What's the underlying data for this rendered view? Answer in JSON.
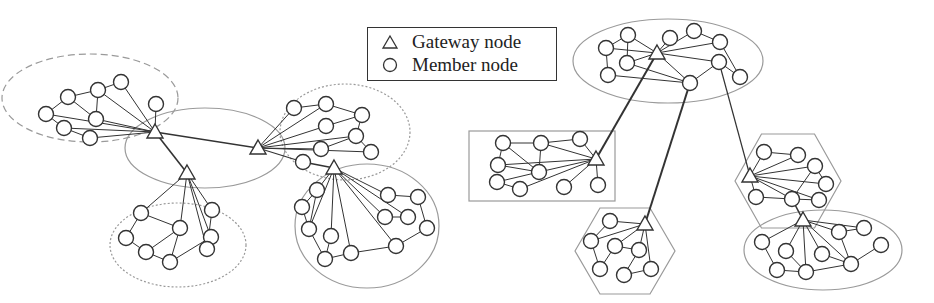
{
  "legend": {
    "items": [
      {
        "symbol": "triangle",
        "label": "Gateway node"
      },
      {
        "symbol": "circle",
        "label": "Member node"
      }
    ]
  },
  "colors": {
    "node_stroke": "#333333",
    "edge": "#333333",
    "cluster_stroke": "#9a9a9a",
    "node_fill": "#ffffff"
  },
  "diagrams": [
    {
      "name": "left-network",
      "clusters": [
        {
          "shape": "ellipse",
          "style": "dashed",
          "cx": 90,
          "cy": 98,
          "rx": 88,
          "ry": 44
        },
        {
          "shape": "ellipse",
          "style": "solid",
          "cx": 205,
          "cy": 148,
          "rx": 80,
          "ry": 40
        },
        {
          "shape": "ellipse",
          "style": "dotted",
          "cx": 345,
          "cy": 132,
          "rx": 65,
          "ry": 48
        },
        {
          "shape": "ellipse",
          "style": "dotted",
          "cx": 178,
          "cy": 245,
          "rx": 68,
          "ry": 42
        },
        {
          "shape": "ellipse",
          "style": "solid",
          "cx": 367,
          "cy": 226,
          "rx": 72,
          "ry": 62
        }
      ],
      "gateways": [
        {
          "id": "G1",
          "x": 155,
          "y": 132
        },
        {
          "id": "G2",
          "x": 258,
          "y": 148
        },
        {
          "id": "G3",
          "x": 187,
          "y": 173
        },
        {
          "id": "G4",
          "x": 334,
          "y": 168
        }
      ],
      "members": [
        {
          "id": "a1",
          "x": 46,
          "y": 114
        },
        {
          "id": "a2",
          "x": 68,
          "y": 97
        },
        {
          "id": "a3",
          "x": 98,
          "y": 90
        },
        {
          "id": "a4",
          "x": 121,
          "y": 82
        },
        {
          "id": "a5",
          "x": 96,
          "y": 119
        },
        {
          "id": "a6",
          "x": 64,
          "y": 128
        },
        {
          "id": "a7",
          "x": 90,
          "y": 138
        },
        {
          "id": "a8",
          "x": 156,
          "y": 104
        },
        {
          "id": "b1",
          "x": 294,
          "y": 108
        },
        {
          "id": "b2",
          "x": 326,
          "y": 104
        },
        {
          "id": "b3",
          "x": 362,
          "y": 115
        },
        {
          "id": "b4",
          "x": 326,
          "y": 126
        },
        {
          "id": "b5",
          "x": 356,
          "y": 136
        },
        {
          "id": "b6",
          "x": 321,
          "y": 149
        },
        {
          "id": "b7",
          "x": 371,
          "y": 152
        },
        {
          "id": "b8",
          "x": 303,
          "y": 162
        },
        {
          "id": "c1",
          "x": 141,
          "y": 213
        },
        {
          "id": "c2",
          "x": 180,
          "y": 228
        },
        {
          "id": "c3",
          "x": 211,
          "y": 237
        },
        {
          "id": "c4",
          "x": 212,
          "y": 210
        },
        {
          "id": "c5",
          "x": 126,
          "y": 238
        },
        {
          "id": "c6",
          "x": 146,
          "y": 252
        },
        {
          "id": "c7",
          "x": 170,
          "y": 262
        },
        {
          "id": "c8",
          "x": 207,
          "y": 249
        },
        {
          "id": "d1",
          "x": 317,
          "y": 190
        },
        {
          "id": "d2",
          "x": 302,
          "y": 207
        },
        {
          "id": "d3",
          "x": 309,
          "y": 229
        },
        {
          "id": "d4",
          "x": 331,
          "y": 236
        },
        {
          "id": "d5",
          "x": 325,
          "y": 259
        },
        {
          "id": "d6",
          "x": 351,
          "y": 253
        },
        {
          "id": "d7",
          "x": 388,
          "y": 195
        },
        {
          "id": "d8",
          "x": 418,
          "y": 197
        },
        {
          "id": "d9",
          "x": 385,
          "y": 217
        },
        {
          "id": "d10",
          "x": 408,
          "y": 217
        },
        {
          "id": "d11",
          "x": 427,
          "y": 228
        },
        {
          "id": "d12",
          "x": 396,
          "y": 246
        }
      ],
      "edges": [
        [
          "G1",
          "G2",
          1.6
        ],
        [
          "G1",
          "G3",
          1.6
        ],
        [
          "G2",
          "b8",
          1.2
        ],
        [
          "b8",
          "G4",
          1.6
        ],
        [
          "a1",
          "a2",
          1
        ],
        [
          "a2",
          "a3",
          1
        ],
        [
          "a3",
          "a4",
          1
        ],
        [
          "a3",
          "a5",
          1
        ],
        [
          "a2",
          "a5",
          1
        ],
        [
          "a1",
          "a6",
          1
        ],
        [
          "a6",
          "a7",
          1
        ],
        [
          "a1",
          "G1",
          1
        ],
        [
          "a3",
          "G1",
          1
        ],
        [
          "a4",
          "G1",
          1
        ],
        [
          "a5",
          "G1",
          1
        ],
        [
          "a6",
          "G1",
          1
        ],
        [
          "a7",
          "G1",
          1
        ],
        [
          "a8",
          "G1",
          1
        ],
        [
          "b1",
          "b2",
          1
        ],
        [
          "b2",
          "b3",
          1
        ],
        [
          "b3",
          "b5",
          1
        ],
        [
          "b4",
          "b3",
          1
        ],
        [
          "b5",
          "b7",
          1
        ],
        [
          "b6",
          "b5",
          1
        ],
        [
          "G2",
          "b1",
          1
        ],
        [
          "G2",
          "b2",
          1
        ],
        [
          "G2",
          "b4",
          1
        ],
        [
          "G2",
          "b5",
          1
        ],
        [
          "G2",
          "b6",
          1
        ],
        [
          "G2",
          "b7",
          1
        ],
        [
          "c1",
          "c5",
          1
        ],
        [
          "c5",
          "c6",
          1
        ],
        [
          "c6",
          "c7",
          1
        ],
        [
          "c7",
          "c3",
          1
        ],
        [
          "c3",
          "c8",
          1
        ],
        [
          "c1",
          "c2",
          1
        ],
        [
          "c2",
          "c6",
          1
        ],
        [
          "c2",
          "c7",
          1
        ],
        [
          "c3",
          "c8",
          1
        ],
        [
          "c4",
          "c8",
          1
        ],
        [
          "G3",
          "c1",
          1
        ],
        [
          "G3",
          "c2",
          1
        ],
        [
          "G3",
          "c3",
          1
        ],
        [
          "G3",
          "c4",
          1
        ],
        [
          "G3",
          "c8",
          1
        ],
        [
          "d1",
          "d2",
          1
        ],
        [
          "d2",
          "d3",
          1
        ],
        [
          "d1",
          "d3",
          1
        ],
        [
          "d3",
          "d5",
          1
        ],
        [
          "d4",
          "d5",
          1
        ],
        [
          "d5",
          "d6",
          1
        ],
        [
          "d6",
          "d12",
          1
        ],
        [
          "d12",
          "d11",
          1
        ],
        [
          "d11",
          "d8",
          1
        ],
        [
          "d8",
          "d7",
          1
        ],
        [
          "d9",
          "d10",
          1
        ],
        [
          "G4",
          "d1",
          1
        ],
        [
          "G4",
          "d3",
          1
        ],
        [
          "G4",
          "d4",
          1
        ],
        [
          "G4",
          "d6",
          1
        ],
        [
          "G4",
          "d7",
          1
        ],
        [
          "G4",
          "d9",
          1
        ],
        [
          "G4",
          "d10",
          1
        ],
        [
          "G4",
          "d12",
          1
        ]
      ]
    },
    {
      "name": "right-network",
      "clusters": [
        {
          "shape": "ellipse",
          "style": "solid",
          "cx": 668,
          "cy": 61,
          "rx": 95,
          "ry": 42
        },
        {
          "shape": "rect",
          "style": "solid",
          "x": 469,
          "y": 131,
          "w": 146,
          "h": 70
        },
        {
          "shape": "hexagon",
          "style": "solid",
          "cx": 625,
          "cy": 251,
          "rx": 50,
          "ry": 43
        },
        {
          "shape": "hexagon",
          "style": "solid",
          "cx": 788,
          "cy": 181,
          "rx": 53,
          "ry": 47
        },
        {
          "shape": "ellipse",
          "style": "solid",
          "cx": 823,
          "cy": 250,
          "rx": 79,
          "ry": 40
        }
      ],
      "gateways": [
        {
          "id": "H1",
          "x": 657,
          "y": 53
        },
        {
          "id": "H2",
          "x": 596,
          "y": 159
        },
        {
          "id": "H3",
          "x": 645,
          "y": 224
        },
        {
          "id": "H4",
          "x": 750,
          "y": 176
        },
        {
          "id": "H5",
          "x": 803,
          "y": 220
        }
      ],
      "members": [
        {
          "id": "e1",
          "x": 628,
          "y": 35
        },
        {
          "id": "e2",
          "x": 670,
          "y": 38
        },
        {
          "id": "e3",
          "x": 694,
          "y": 31
        },
        {
          "id": "e4",
          "x": 720,
          "y": 42
        },
        {
          "id": "e5",
          "x": 606,
          "y": 48
        },
        {
          "id": "e6",
          "x": 627,
          "y": 63
        },
        {
          "id": "e7",
          "x": 608,
          "y": 75
        },
        {
          "id": "e8",
          "x": 719,
          "y": 62
        },
        {
          "id": "e9",
          "x": 740,
          "y": 77
        },
        {
          "id": "e10",
          "x": 690,
          "y": 83
        },
        {
          "id": "f1",
          "x": 503,
          "y": 143
        },
        {
          "id": "f2",
          "x": 541,
          "y": 143
        },
        {
          "id": "f3",
          "x": 580,
          "y": 139
        },
        {
          "id": "f4",
          "x": 498,
          "y": 165
        },
        {
          "id": "f5",
          "x": 539,
          "y": 172
        },
        {
          "id": "f6",
          "x": 497,
          "y": 182
        },
        {
          "id": "f7",
          "x": 520,
          "y": 189
        },
        {
          "id": "f8",
          "x": 564,
          "y": 187
        },
        {
          "id": "f9",
          "x": 598,
          "y": 185
        },
        {
          "id": "h1",
          "x": 610,
          "y": 221
        },
        {
          "id": "h2",
          "x": 591,
          "y": 241
        },
        {
          "id": "h3",
          "x": 615,
          "y": 246
        },
        {
          "id": "h4",
          "x": 639,
          "y": 250
        },
        {
          "id": "h5",
          "x": 600,
          "y": 269
        },
        {
          "id": "h6",
          "x": 624,
          "y": 275
        },
        {
          "id": "h7",
          "x": 651,
          "y": 269
        },
        {
          "id": "i1",
          "x": 764,
          "y": 152
        },
        {
          "id": "i2",
          "x": 798,
          "y": 155
        },
        {
          "id": "i3",
          "x": 815,
          "y": 166
        },
        {
          "id": "i4",
          "x": 826,
          "y": 184
        },
        {
          "id": "i5",
          "x": 756,
          "y": 197
        },
        {
          "id": "i6",
          "x": 792,
          "y": 199
        },
        {
          "id": "i7",
          "x": 819,
          "y": 200
        },
        {
          "id": "j1",
          "x": 762,
          "y": 242
        },
        {
          "id": "j2",
          "x": 786,
          "y": 251
        },
        {
          "id": "j3",
          "x": 822,
          "y": 254
        },
        {
          "id": "j4",
          "x": 839,
          "y": 232
        },
        {
          "id": "j5",
          "x": 864,
          "y": 228
        },
        {
          "id": "j6",
          "x": 881,
          "y": 245
        },
        {
          "id": "j7",
          "x": 777,
          "y": 270
        },
        {
          "id": "j8",
          "x": 806,
          "y": 272
        },
        {
          "id": "j9",
          "x": 851,
          "y": 264
        }
      ],
      "edges": [
        [
          "H1",
          "H2",
          2
        ],
        [
          "e10",
          "H3",
          2
        ],
        [
          "e8",
          "H4",
          1.2
        ],
        [
          "i6",
          "H5",
          1.6
        ],
        [
          "e5",
          "e1",
          1
        ],
        [
          "e1",
          "e6",
          1
        ],
        [
          "e5",
          "e7",
          1
        ],
        [
          "e1",
          "H1",
          1
        ],
        [
          "e5",
          "H1",
          1
        ],
        [
          "e6",
          "H1",
          1
        ],
        [
          "e7",
          "e10",
          1
        ],
        [
          "H1",
          "e2",
          1
        ],
        [
          "H1",
          "e3",
          1
        ],
        [
          "H1",
          "e4",
          1
        ],
        [
          "H1",
          "e8",
          1
        ],
        [
          "H1",
          "e10",
          1
        ],
        [
          "e6",
          "e10",
          1
        ],
        [
          "e3",
          "e4",
          1
        ],
        [
          "e4",
          "e9",
          1
        ],
        [
          "e8",
          "e9",
          1
        ],
        [
          "e8",
          "e10",
          1
        ],
        [
          "f1",
          "f2",
          1
        ],
        [
          "f1",
          "f4",
          1
        ],
        [
          "f1",
          "f5",
          1
        ],
        [
          "f2",
          "f5",
          1
        ],
        [
          "f2",
          "f3",
          1
        ],
        [
          "f4",
          "f5",
          1
        ],
        [
          "f6",
          "f5",
          1
        ],
        [
          "f6",
          "f7",
          1
        ],
        [
          "f2",
          "H2",
          1
        ],
        [
          "f3",
          "H2",
          1
        ],
        [
          "f4",
          "H2",
          1
        ],
        [
          "f5",
          "H2",
          1
        ],
        [
          "f7",
          "H2",
          1
        ],
        [
          "f8",
          "H2",
          1
        ],
        [
          "f9",
          "H2",
          1
        ],
        [
          "h1",
          "h2",
          1
        ],
        [
          "h2",
          "h5",
          1
        ],
        [
          "h5",
          "h3",
          1
        ],
        [
          "h3",
          "h4",
          1
        ],
        [
          "h4",
          "h6",
          1
        ],
        [
          "h6",
          "h7",
          1
        ],
        [
          "H3",
          "h1",
          1
        ],
        [
          "H3",
          "h2",
          1
        ],
        [
          "H3",
          "h3",
          1
        ],
        [
          "H3",
          "h4",
          1
        ],
        [
          "H3",
          "h7",
          1
        ],
        [
          "i1",
          "i2",
          1
        ],
        [
          "i3",
          "i4",
          1
        ],
        [
          "i3",
          "i6",
          1
        ],
        [
          "i5",
          "i6",
          1
        ],
        [
          "i6",
          "i7",
          1
        ],
        [
          "H4",
          "i1",
          1
        ],
        [
          "H4",
          "i2",
          1
        ],
        [
          "H4",
          "i3",
          1
        ],
        [
          "H4",
          "i4",
          1
        ],
        [
          "H4",
          "i6",
          1
        ],
        [
          "H4",
          "i7",
          1
        ],
        [
          "H4",
          "i5",
          1
        ],
        [
          "j1",
          "j7",
          1
        ],
        [
          "j7",
          "j8",
          1
        ],
        [
          "j8",
          "j9",
          1
        ],
        [
          "j9",
          "j6",
          1
        ],
        [
          "j2",
          "j8",
          1
        ],
        [
          "j3",
          "j9",
          1
        ],
        [
          "j4",
          "j5",
          1
        ],
        [
          "j4",
          "j9",
          1
        ],
        [
          "H5",
          "j1",
          1
        ],
        [
          "H5",
          "j2",
          1
        ],
        [
          "H5",
          "j3",
          1
        ],
        [
          "H5",
          "j4",
          1
        ],
        [
          "H5",
          "j8",
          1
        ],
        [
          "H5",
          "j9",
          1
        ],
        [
          "H5",
          "j5",
          1
        ]
      ]
    }
  ]
}
